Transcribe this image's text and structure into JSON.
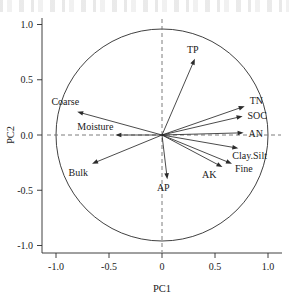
{
  "figure": {
    "type": "pca-biplot",
    "background_color": "#ffffff",
    "ink_color": "#2b2b2b"
  },
  "chart_data": {
    "type": "scatter",
    "subtype": "pca-correlation-circle-biplot",
    "title": "",
    "xlabel": "PC1",
    "ylabel": "PC2",
    "xlim": [
      -1.15,
      1.15
    ],
    "ylim": [
      -1.15,
      1.15
    ],
    "xticks": [
      "-1.0",
      "-0.5",
      "0",
      "0.5",
      "1.0"
    ],
    "xtick_values": [
      -1.0,
      -0.5,
      0,
      0.5,
      1.0
    ],
    "yticks": [
      "1.0",
      "0.5",
      "0.0",
      "-0.5",
      "-1.0"
    ],
    "ytick_values": [
      1.0,
      0.5,
      0.0,
      -0.5,
      -1.0
    ],
    "grid": false,
    "legend": "none",
    "unit_circle": true,
    "unit_circle_radius": 1.0,
    "reference_lines": [
      {
        "axis": "horizontal",
        "value": 0,
        "style": "dashed"
      },
      {
        "axis": "vertical",
        "value": 0,
        "style": "dashed"
      }
    ],
    "vectors": [
      {
        "label": "TP",
        "x": 0.31,
        "y": 0.69,
        "label_dx": -2,
        "label_dy": -6
      },
      {
        "label": "Coarse",
        "x": -0.8,
        "y": 0.21,
        "label_dx": 2,
        "label_dy": -7
      },
      {
        "label": "TN",
        "x": 0.78,
        "y": 0.26,
        "label_dx": 5,
        "label_dy": -2
      },
      {
        "label": "SOC",
        "x": 0.76,
        "y": 0.17,
        "label_dx": 5,
        "label_dy": 3
      },
      {
        "label": "AN",
        "x": 0.77,
        "y": 0.02,
        "label_dx": 5,
        "label_dy": 4
      },
      {
        "label": "Moisture",
        "x": -0.44,
        "y": 0.0,
        "label_dx": -2,
        "label_dy": -5
      },
      {
        "label": "Clay.Silt",
        "x": 0.72,
        "y": -0.12,
        "label_dx": -6,
        "label_dy": 11
      },
      {
        "label": "Bulk",
        "x": -0.66,
        "y": -0.26,
        "label_dx": -4,
        "label_dy": 12
      },
      {
        "label": "AK",
        "x": 0.57,
        "y": -0.29,
        "label_dx": -6,
        "label_dy": 11
      },
      {
        "label": "Fine",
        "x": 0.66,
        "y": -0.26,
        "label_dx": 3,
        "label_dy": 8
      },
      {
        "label": "AP",
        "x": 0.05,
        "y": -0.4,
        "label_dx": -4,
        "label_dy": 12
      }
    ]
  },
  "axes": {
    "x_title": "PC1",
    "y_title": "PC2"
  }
}
